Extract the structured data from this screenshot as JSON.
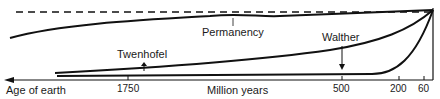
{
  "diagram": {
    "type": "schematic-curves",
    "labels": {
      "permanency": "Permanency",
      "walther": "Walther",
      "twenhofel": "Twenhofel",
      "axis_left": "Age of earth",
      "axis_center": "Million years"
    },
    "ticks": [
      {
        "label": "1750",
        "x": 128
      },
      {
        "label": "500",
        "x": 342
      },
      {
        "label": "200",
        "x": 399
      },
      {
        "label": "60",
        "x": 424
      }
    ],
    "curves": [
      "Permanency",
      "Walther",
      "Twenhofel"
    ],
    "reference_line": "dashed horizontal at top (present-day level)",
    "colors": {
      "ink": "#111111",
      "background": "#ffffff"
    }
  }
}
